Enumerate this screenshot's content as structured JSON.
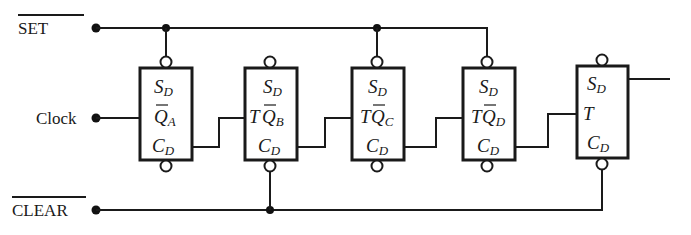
{
  "diagram": {
    "type": "circuit-schematic",
    "inputs": {
      "set": {
        "label": "SET",
        "overbar": true
      },
      "clock": {
        "label": "Clock"
      },
      "clear": {
        "label": "CLEAR",
        "overbar": true
      }
    },
    "flip_flops": [
      {
        "id": "A",
        "set_pin": "S",
        "set_sub": "D",
        "mid_prefix": "",
        "mid_pin": "Q",
        "mid_sub": "A",
        "mid_overbar": true,
        "clear_pin": "C",
        "clear_sub": "D"
      },
      {
        "id": "B",
        "set_pin": "S",
        "set_sub": "D",
        "mid_prefix": "T",
        "mid_pin": "Q",
        "mid_sub": "B",
        "mid_overbar": true,
        "clear_pin": "C",
        "clear_sub": "D"
      },
      {
        "id": "C",
        "set_pin": "S",
        "set_sub": "D",
        "mid_prefix": "T",
        "mid_pin": "Q",
        "mid_sub": "C",
        "mid_overbar": true,
        "clear_pin": "C",
        "clear_sub": "D"
      },
      {
        "id": "D",
        "set_pin": "S",
        "set_sub": "D",
        "mid_prefix": "T",
        "mid_pin": "Q",
        "mid_sub": "D",
        "mid_overbar": true,
        "clear_pin": "C",
        "clear_sub": "D"
      },
      {
        "id": "E",
        "set_pin": "S",
        "set_sub": "D",
        "mid_prefix": "T",
        "mid_pin": "",
        "mid_sub": "",
        "mid_overbar": false,
        "clear_pin": "C",
        "clear_sub": "D"
      }
    ],
    "colors": {
      "ink": "#1a1a1a",
      "background": "#ffffff"
    }
  }
}
